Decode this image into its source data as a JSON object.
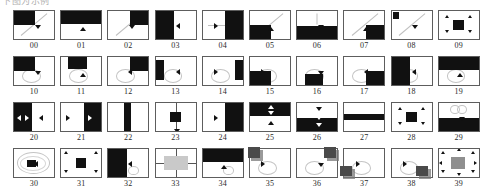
{
  "figure": {
    "top_caption": "下图为示例",
    "columns": 10,
    "rows": 4,
    "total_items": 40,
    "colors": {
      "ink": "#111111",
      "frame": "#5d5d5d",
      "trace": "#c4c4c4",
      "gray_fill": "#c9c9c9",
      "shadow": "#787878"
    }
  },
  "items": [
    {
      "id": "00",
      "label": "00",
      "fill": "top-left-quadrant",
      "marker": "down",
      "trace": "diagonal"
    },
    {
      "id": "01",
      "label": "01",
      "fill": "top-half",
      "marker": "up",
      "trace": "none"
    },
    {
      "id": "02",
      "label": "02",
      "fill": "top-right-quadrant",
      "marker": "down",
      "trace": "diagonal"
    },
    {
      "id": "03",
      "label": "03",
      "fill": "left-half",
      "marker": "left",
      "trace": "none"
    },
    {
      "id": "04",
      "label": "04",
      "fill": "right-half",
      "marker": "right",
      "trace": "horizontal"
    },
    {
      "id": "05",
      "label": "05",
      "fill": "bottom-left-quadrant",
      "marker": "up",
      "trace": "diagonal"
    },
    {
      "id": "06",
      "label": "06",
      "fill": "bottom-half",
      "marker": "down",
      "trace": "vertical"
    },
    {
      "id": "07",
      "label": "07",
      "fill": "bottom-right-quadrant",
      "marker": "up",
      "trace": "diagonal"
    },
    {
      "id": "08",
      "label": "08",
      "fill": "corner-square-top-left",
      "marker": "down",
      "trace": "diagonal"
    },
    {
      "id": "09",
      "label": "09",
      "fill": "center-square",
      "marker": "four-corners",
      "trace": "none"
    },
    {
      "id": "10",
      "label": "10",
      "fill": "top-left-quadrant",
      "marker": "down",
      "trace": "loop"
    },
    {
      "id": "11",
      "label": "11",
      "fill": "top-band-center",
      "marker": "up",
      "trace": "loop"
    },
    {
      "id": "12",
      "label": "12",
      "fill": "top-right-quadrant",
      "marker": "left",
      "trace": "loop"
    },
    {
      "id": "13",
      "label": "13",
      "fill": "left-band",
      "marker": "left",
      "trace": "loop"
    },
    {
      "id": "14",
      "label": "14",
      "fill": "right-band",
      "marker": "right",
      "trace": "loop"
    },
    {
      "id": "15",
      "label": "15",
      "fill": "bottom-left-quadrant",
      "marker": "right",
      "trace": "loop"
    },
    {
      "id": "16",
      "label": "16",
      "fill": "bottom-band-center",
      "marker": "down",
      "trace": "loop"
    },
    {
      "id": "17",
      "label": "17",
      "fill": "bottom-right-quadrant",
      "marker": "left",
      "trace": "loop"
    },
    {
      "id": "18",
      "label": "18",
      "fill": "left-half",
      "marker": "left",
      "trace": "loop"
    },
    {
      "id": "19",
      "label": "19",
      "fill": "top-half",
      "marker": "up",
      "trace": "loop"
    },
    {
      "id": "20",
      "label": "20",
      "fill": "left-half",
      "marker": "left-right-left",
      "trace": "none"
    },
    {
      "id": "21",
      "label": "21",
      "fill": "right-half",
      "marker": "right-left-right",
      "trace": "none"
    },
    {
      "id": "22",
      "label": "22",
      "fill": "center-vertical-band",
      "marker": "none",
      "trace": "none"
    },
    {
      "id": "23",
      "label": "23",
      "fill": "center-square",
      "marker": "vertical-axis",
      "trace": "axis"
    },
    {
      "id": "24",
      "label": "24",
      "fill": "right-half",
      "marker": "right",
      "trace": "none"
    },
    {
      "id": "25",
      "label": "25",
      "fill": "top-half",
      "marker": "up-down-pair",
      "trace": "none"
    },
    {
      "id": "26",
      "label": "26",
      "fill": "bottom-half",
      "marker": "down-pair",
      "trace": "none"
    },
    {
      "id": "27",
      "label": "27",
      "fill": "center-horizontal-band",
      "marker": "none",
      "trace": "none"
    },
    {
      "id": "28",
      "label": "28",
      "fill": "center-square",
      "marker": "four-corners",
      "trace": "none"
    },
    {
      "id": "29",
      "label": "29",
      "fill": "bottom-half",
      "marker": "down",
      "trace": "double-loop"
    },
    {
      "id": "30",
      "label": "30",
      "fill": "center-small-square",
      "marker": "left",
      "trace": "big-loop"
    },
    {
      "id": "31",
      "label": "31",
      "fill": "center-square",
      "marker": "four-corners-out",
      "trace": "none"
    },
    {
      "id": "32",
      "label": "32",
      "fill": "left-half",
      "marker": "left",
      "trace": "squiggle"
    },
    {
      "id": "33",
      "label": "33",
      "fill": "center-gray-rect",
      "marker": "four-sides",
      "trace": "cross-axis"
    },
    {
      "id": "34",
      "label": "34",
      "fill": "top-half",
      "marker": "up",
      "trace": "squiggle"
    },
    {
      "id": "35",
      "label": "35",
      "fill": "shadow-square-top-left",
      "marker": "right",
      "trace": "loop"
    },
    {
      "id": "36",
      "label": "36",
      "fill": "shadow-square-top-right",
      "marker": "down",
      "trace": "loop"
    },
    {
      "id": "37",
      "label": "37",
      "fill": "shadow-square-bottom-left",
      "marker": "right",
      "trace": "loop"
    },
    {
      "id": "38",
      "label": "38",
      "fill": "shadow-square-bottom-right",
      "marker": "right",
      "trace": "loop"
    },
    {
      "id": "39",
      "label": "39",
      "fill": "center-gray-square",
      "marker": "eight-arrows",
      "trace": "none"
    }
  ]
}
